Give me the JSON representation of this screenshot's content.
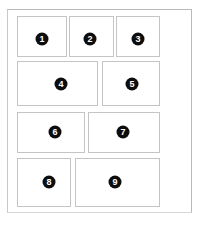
{
  "page": {
    "background_color": "#ffffff",
    "frame_color": "#b9b9b9",
    "card_border_color": "#c4c4c4",
    "card_fill_color": "#ffffff",
    "badge_color": "#0d0d0d",
    "badge_text_color": "#ffffff"
  },
  "frame": {
    "x": 7,
    "y": 9,
    "width": 185,
    "height": 204
  },
  "cards": [
    {
      "label": "1",
      "x": 17,
      "y": 16,
      "width": 50,
      "height": 41,
      "badge_x": 42,
      "badge_y": 39
    },
    {
      "label": "2",
      "x": 69,
      "y": 16,
      "width": 45,
      "height": 41,
      "badge_x": 90,
      "badge_y": 39
    },
    {
      "label": "3",
      "x": 116,
      "y": 16,
      "width": 44,
      "height": 41,
      "badge_x": 138,
      "badge_y": 39
    },
    {
      "label": "4",
      "x": 17,
      "y": 61,
      "width": 81,
      "height": 45,
      "badge_x": 61,
      "badge_y": 84
    },
    {
      "label": "5",
      "x": 102,
      "y": 61,
      "width": 58,
      "height": 45,
      "badge_x": 132,
      "badge_y": 84
    },
    {
      "label": "6",
      "x": 17,
      "y": 112,
      "width": 68,
      "height": 41,
      "badge_x": 55,
      "badge_y": 132
    },
    {
      "label": "7",
      "x": 88,
      "y": 112,
      "width": 72,
      "height": 41,
      "badge_x": 123,
      "badge_y": 132
    },
    {
      "label": "8",
      "x": 17,
      "y": 158,
      "width": 54,
      "height": 49,
      "badge_x": 49,
      "badge_y": 182
    },
    {
      "label": "9",
      "x": 75,
      "y": 158,
      "width": 85,
      "height": 49,
      "badge_x": 115,
      "badge_y": 182
    }
  ]
}
